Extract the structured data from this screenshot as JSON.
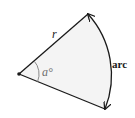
{
  "diagram": {
    "type": "circular-sector",
    "vertex": {
      "x": 19,
      "y": 74
    },
    "radius_end_top": {
      "x": 88,
      "y": 14
    },
    "radius_end_bottom": {
      "x": 105,
      "y": 109
    },
    "labels": {
      "radius": "r",
      "angle": "a°",
      "arc": "arc"
    },
    "colors": {
      "fill": "#f4f4f4",
      "stroke": "#1a1a1a",
      "angle_marker": "#8a8a8a",
      "angle_label": "#6e6e6e",
      "text": "#1a1a1a"
    }
  }
}
